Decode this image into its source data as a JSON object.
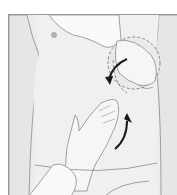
{
  "figure": {
    "elements": [
      "torso",
      "nipple",
      "examiner-upper-hand",
      "examiner-lower-hand",
      "dashed-circle-organ-outline",
      "rotation-arrow-upper",
      "rotation-arrow-lower",
      "sleeve-upper",
      "sleeve-lower",
      "underwear-waistband"
    ]
  },
  "colors": {
    "background": "#ffffff",
    "skin": "#eeeeee",
    "outline": "#8a8a8a",
    "arrow": "#1a1a1a",
    "sleeve": "#fafafa"
  }
}
